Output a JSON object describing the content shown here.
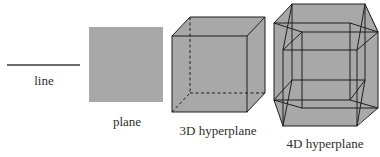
{
  "figure": {
    "colors": {
      "fill": "#a8a8a8",
      "edge": "#1e1e1e",
      "line": "#3a3a3a",
      "text": "#2e2e2e",
      "background": "#ffffff"
    },
    "items": [
      {
        "id": "line",
        "label": "line",
        "dimension": 1
      },
      {
        "id": "plane",
        "label": "plane",
        "dimension": 2
      },
      {
        "id": "cube",
        "label": "3D hyperplane",
        "dimension": 3
      },
      {
        "id": "tesseract",
        "label": "4D hyperplane",
        "dimension": 4
      }
    ]
  }
}
